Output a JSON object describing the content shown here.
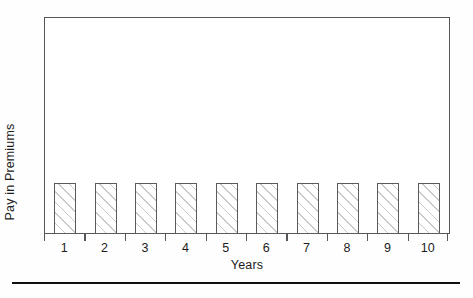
{
  "chart_data": {
    "type": "bar",
    "title": "",
    "subtitle": "",
    "xlabel": "Years",
    "ylabel": "Pay in Premiums",
    "categories": [
      "1",
      "2",
      "3",
      "4",
      "5",
      "6",
      "7",
      "8",
      "9",
      "10"
    ],
    "values": [
      1,
      1,
      1,
      1,
      1,
      1,
      1,
      1,
      1,
      1
    ],
    "ylim": [
      0,
      4.25
    ],
    "grid": false,
    "legend": null,
    "annotations": [],
    "series": [
      {
        "name": "Pay in Premiums",
        "values": [
          1,
          1,
          1,
          1,
          1,
          1,
          1,
          1,
          1,
          1
        ]
      }
    ],
    "style": {
      "bar_fill": "#ffffff",
      "bar_hatch": "diagonal",
      "bar_hatch_color": "#c9c9cc",
      "bar_edge_color": "#5a5a5f",
      "frame_color": "#55555a",
      "text_color": "#1c1c1c",
      "background": "#fefefe",
      "rule_color": "#111111"
    }
  },
  "figure": {
    "y_axis_title": "Pay in Premiums",
    "x_axis_title": "Years",
    "tick_labels": [
      "1",
      "2",
      "3",
      "4",
      "5",
      "6",
      "7",
      "8",
      "9",
      "10"
    ]
  }
}
